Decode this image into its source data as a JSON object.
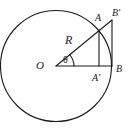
{
  "figure": {
    "type": "geometry-diagram",
    "stroke_color": "#1a1a1a",
    "background_color": "#ffffff",
    "labels": {
      "center": "O",
      "radius": "R",
      "angle": "θ",
      "point_a": "A",
      "point_a_prime": "A′",
      "point_b": "B",
      "point_b_prime": "B′"
    },
    "geometry": {
      "circle": {
        "cx": 56,
        "cy": 66,
        "r": 56
      },
      "center_point": {
        "x": 56,
        "y": 66
      },
      "point_a": {
        "x": 99,
        "y": 30
      },
      "point_a_prime": {
        "x": 99,
        "y": 66
      },
      "point_b": {
        "x": 112,
        "y": 66
      },
      "point_b_prime": {
        "x": 112,
        "y": 20
      },
      "angle_arc_radius": 16,
      "angle_degrees": 40
    }
  }
}
